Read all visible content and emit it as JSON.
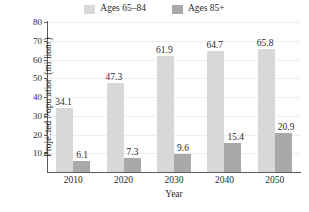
{
  "chart_data": {
    "type": "bar",
    "title": "",
    "xlabel": "Year",
    "ylabel": "Projected Population (millions)",
    "categories": [
      "2010",
      "2020",
      "2030",
      "2040",
      "2050"
    ],
    "series": [
      {
        "name": "Ages 65–84",
        "color": "#d8d8d8",
        "values": [
          34.1,
          47.3,
          61.9,
          64.7,
          65.8
        ]
      },
      {
        "name": "Ages 85+",
        "color": "#a9a9a9",
        "values": [
          6.1,
          7.3,
          9.6,
          15.4,
          20.9
        ]
      }
    ],
    "ylim": [
      0,
      80
    ],
    "yticks": [
      10,
      20,
      30,
      40,
      50,
      60,
      70,
      80
    ],
    "grid": true,
    "legend_position": "top"
  },
  "legend": {
    "items": [
      {
        "label": "Ages 65–84",
        "color": "#d8d8d8"
      },
      {
        "label": "Ages 85+",
        "color": "#a9a9a9"
      }
    ]
  },
  "axes": {
    "y_title": "Projected Population (millions)",
    "x_title": "Year"
  }
}
